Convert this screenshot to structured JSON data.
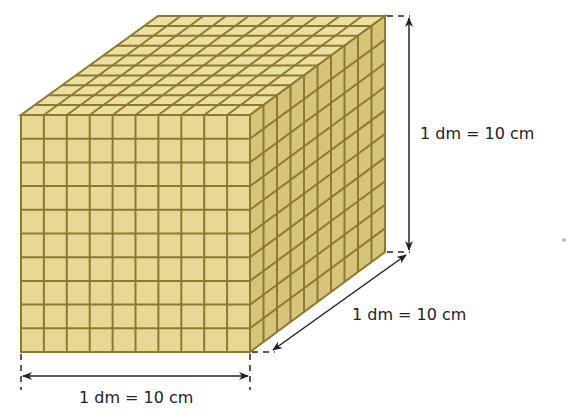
{
  "figure": {
    "grid_divisions": 10,
    "colors": {
      "top": "#ecdfa2",
      "front": "#e8d896",
      "side": "#d6c47a",
      "grid_line": "#8d7a2c",
      "dimension_line": "#222222"
    },
    "dimensions": {
      "height_label": "1 dm = 10 cm",
      "depth_label": "1 dm = 10 cm",
      "width_label": "1 dm = 10 cm"
    }
  }
}
